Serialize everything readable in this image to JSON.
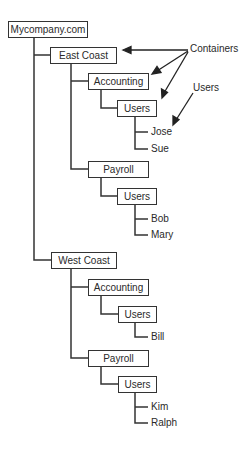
{
  "diagram": {
    "root": "Mycompany.com",
    "nodes": {
      "east_coast": "East Coast",
      "east_accounting": "Accounting",
      "east_accounting_users": "Users",
      "east_payroll": "Payroll",
      "east_payroll_users": "Users",
      "west_coast": "West Coast",
      "west_accounting": "Accounting",
      "west_accounting_users": "Users",
      "west_payroll": "Payroll",
      "west_payroll_users": "Users"
    },
    "users": {
      "jose": "Jose",
      "sue": "Sue",
      "bob": "Bob",
      "mary": "Mary",
      "bill": "Bill",
      "kim": "Kim",
      "ralph": "Ralph"
    },
    "annotations": {
      "containers": "Containers",
      "users": "Users"
    },
    "colors": {
      "line": "#333333",
      "text": "#2a2a2a"
    }
  }
}
